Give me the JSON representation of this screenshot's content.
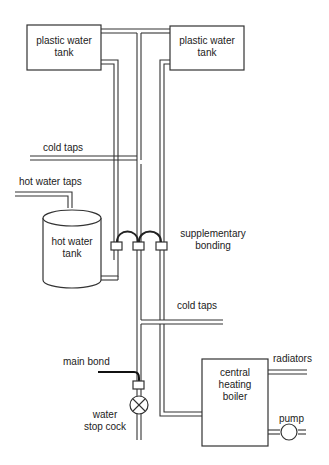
{
  "labels": {
    "tank_left": [
      "plastic water",
      "tank"
    ],
    "tank_right": [
      "plastic water",
      "tank"
    ],
    "cold_taps_upper": "cold taps",
    "hot_water_taps": "hot water taps",
    "hot_water_tank": [
      "hot water",
      "tank"
    ],
    "supplementary_bonding": [
      "supplementary",
      "bonding"
    ],
    "cold_taps_lower": "cold taps",
    "main_bond": "main bond",
    "stop_cock": [
      "water",
      "stop cock"
    ],
    "boiler": [
      "central",
      "heating",
      "boiler"
    ],
    "radiators": "radiators",
    "pump": "pump"
  },
  "colors": {
    "line": "#333333",
    "text": "#222222",
    "background": "#ffffff"
  }
}
